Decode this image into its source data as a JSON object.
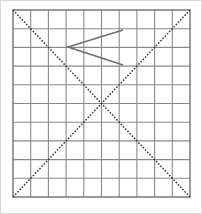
{
  "figure": {
    "caption": "A 10 by 10 square grid. Two dotted diagonal lines run corner to corner forming an X that crosses at the grid center. An open chevron shape, like a less-than sign, sits in the upper area of the grid.",
    "background_color": "#ffffff",
    "width": 202,
    "height": 214
  },
  "grid": {
    "name": "square-grid",
    "columns": 10,
    "rows": 10,
    "left": 13,
    "top": 10,
    "right": 190,
    "bottom": 197,
    "cell_width": 17.7,
    "cell_height": 18.7,
    "line_color": "#8a8a8a",
    "line_width": 1.1,
    "border_color": "#707070",
    "border_width": 1.4
  },
  "diagonals": {
    "name": "crossing-diagonals",
    "color": "#3a3a3a",
    "line_width": 1.5,
    "dash_pattern": "1.6 1.6",
    "intersection": {
      "x": 101,
      "y": 104
    },
    "lines": [
      {
        "label": "diagonal-top-left-to-bottom-right",
        "x1": 13,
        "y1": 10,
        "x2": 190,
        "y2": 197
      },
      {
        "label": "diagonal-bottom-left-to-top-right",
        "x1": 13,
        "y1": 197,
        "x2": 190,
        "y2": 10
      }
    ]
  },
  "chevron": {
    "name": "chevron-polyline",
    "color": "#6e6e6e",
    "line_width": 1.6,
    "points": "123,30 68,47 123,65",
    "vertex": {
      "x": 68,
      "y": 47
    },
    "upper_endpoint": {
      "x": 123,
      "y": 30
    },
    "lower_endpoint": {
      "x": 123,
      "y": 65
    }
  },
  "canvas_border": {
    "name": "canvas-border",
    "color": "#d8d8d8",
    "line_width": 1
  }
}
